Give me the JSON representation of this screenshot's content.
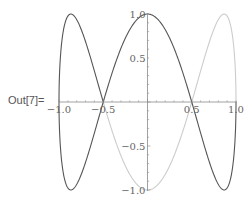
{
  "cell": {
    "output_label": "Out[7]=",
    "top_text_partial": "(partially cut-off input line)"
  },
  "colors": {
    "axis": "#8a8a8a",
    "series_dark": "#555555",
    "series_light": "#cccccc",
    "tick_label": "#666666"
  },
  "chart_data": {
    "type": "line",
    "title": "",
    "xlabel": "",
    "ylabel": "",
    "xlim": [
      -1.0,
      1.0
    ],
    "ylim": [
      -1.0,
      1.0
    ],
    "grid": false,
    "legend": "none",
    "x_ticks": [
      "-1.0",
      "-0.5",
      "0.5",
      "1.0"
    ],
    "y_ticks": [
      "1.0",
      "0.5",
      "-0.5",
      "-1.0"
    ],
    "series": [
      {
        "name": "dark segment",
        "color": "#555555",
        "param_range": "t in [7π/6, 5π/2]",
        "key_points": [
          [
            -0.5,
            0
          ],
          [
            -0.87,
            1
          ],
          [
            -1,
            0
          ],
          [
            -0.87,
            -1
          ],
          [
            -0.5,
            0
          ],
          [
            0,
            1
          ],
          [
            0.5,
            0
          ],
          [
            0.87,
            -1
          ],
          [
            1,
            0
          ]
        ]
      },
      {
        "name": "light segment",
        "color": "#cccccc",
        "param_range": "t in [π/2, 7π/6]",
        "key_points": [
          [
            1,
            0
          ],
          [
            0.87,
            1
          ],
          [
            0.5,
            0
          ],
          [
            0,
            -1
          ],
          [
            -0.5,
            0
          ]
        ]
      }
    ]
  }
}
